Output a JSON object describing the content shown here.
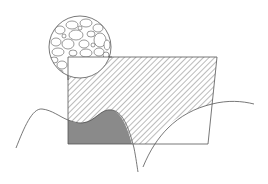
{
  "figure": {
    "type": "patent-style schematic illustration",
    "colors": {
      "stroke": "#555555",
      "hatch": "#777777",
      "fill_gray": "#8a8a8a",
      "background": "#ffffff",
      "pebble_stroke": "#555555"
    },
    "elements": [
      {
        "name": "magnified-circle",
        "description": "circular inset showing pebble/aggregate texture"
      },
      {
        "name": "hatched-block",
        "description": "rectangular block with diagonal hatching"
      },
      {
        "name": "gray-region",
        "description": "solid gray filled region at lower-left of block"
      },
      {
        "name": "left-wave-line",
        "description": "undulating curve across left side"
      },
      {
        "name": "right-wave-line",
        "description": "rising curve across right side"
      }
    ]
  }
}
